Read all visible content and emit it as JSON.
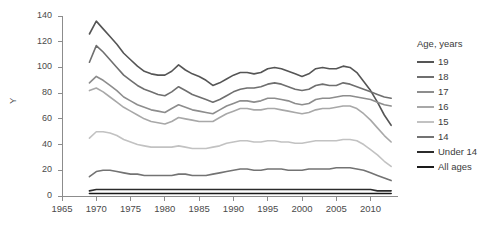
{
  "axis": {
    "y_title": "Y",
    "y_ticks": [
      0,
      20,
      40,
      60,
      80,
      100,
      120,
      140
    ],
    "x_ticks": [
      1965,
      1970,
      1975,
      1980,
      1985,
      1990,
      1995,
      2000,
      2005,
      2010
    ]
  },
  "legend": {
    "title": "Age, years",
    "items": [
      {
        "label": "19",
        "color": "#555555"
      },
      {
        "label": "18",
        "color": "#6f6f6f"
      },
      {
        "label": "17",
        "color": "#8d8d8d"
      },
      {
        "label": "16",
        "color": "#a8a8a8"
      },
      {
        "label": "15",
        "color": "#c2c2c2"
      },
      {
        "label": "14",
        "color": "#737373"
      },
      {
        "label": "Under 14",
        "color": "#2b2b2b"
      },
      {
        "label": "All ages",
        "color": "#1a1a1a"
      }
    ]
  },
  "chart_data": {
    "type": "line",
    "title": "",
    "xlabel": "",
    "ylabel": "Y",
    "xlim": [
      1965,
      2014
    ],
    "ylim": [
      0,
      140
    ],
    "grid": false,
    "legend_position": "right",
    "legend_title": "Age, years",
    "x": [
      1969,
      1970,
      1971,
      1972,
      1973,
      1974,
      1975,
      1976,
      1977,
      1978,
      1979,
      1980,
      1981,
      1982,
      1983,
      1984,
      1985,
      1986,
      1987,
      1988,
      1989,
      1990,
      1991,
      1992,
      1993,
      1994,
      1995,
      1996,
      1997,
      1998,
      1999,
      2000,
      2001,
      2002,
      2003,
      2004,
      2005,
      2006,
      2007,
      2008,
      2009,
      2010,
      2011,
      2012,
      2013
    ],
    "series": [
      {
        "name": "19",
        "color": "#555555",
        "values": [
          126,
          136,
          130,
          124,
          118,
          111,
          106,
          101,
          97,
          95,
          94,
          94,
          97,
          102,
          98,
          95,
          93,
          90,
          86,
          88,
          91,
          94,
          96,
          96,
          95,
          96,
          99,
          100,
          99,
          97,
          95,
          93,
          95,
          99,
          100,
          99,
          99,
          101,
          100,
          96,
          89,
          82,
          73,
          63,
          55
        ]
      },
      {
        "name": "18",
        "color": "#6f6f6f",
        "values": [
          104,
          117,
          112,
          106,
          100,
          94,
          90,
          86,
          83,
          81,
          79,
          78,
          81,
          85,
          82,
          79,
          77,
          75,
          73,
          75,
          78,
          81,
          83,
          84,
          84,
          85,
          87,
          88,
          87,
          85,
          83,
          82,
          83,
          86,
          87,
          86,
          86,
          88,
          87,
          85,
          83,
          81,
          79,
          77,
          76
        ]
      },
      {
        "name": "17",
        "color": "#8d8d8d",
        "values": [
          88,
          93,
          90,
          86,
          82,
          77,
          74,
          71,
          69,
          67,
          66,
          65,
          68,
          71,
          69,
          67,
          66,
          65,
          64,
          67,
          70,
          72,
          74,
          74,
          73,
          74,
          76,
          76,
          75,
          74,
          72,
          71,
          72,
          75,
          76,
          76,
          77,
          78,
          78,
          77,
          76,
          75,
          73,
          71,
          70
        ]
      },
      {
        "name": "16",
        "color": "#a8a8a8",
        "values": [
          82,
          84,
          81,
          77,
          73,
          69,
          66,
          63,
          60,
          58,
          57,
          56,
          58,
          61,
          60,
          59,
          58,
          58,
          58,
          61,
          64,
          66,
          68,
          68,
          67,
          67,
          68,
          68,
          67,
          66,
          65,
          64,
          65,
          67,
          68,
          68,
          69,
          70,
          70,
          68,
          64,
          59,
          53,
          47,
          42
        ]
      },
      {
        "name": "15",
        "color": "#c2c2c2",
        "values": [
          45,
          50,
          50,
          49,
          47,
          44,
          42,
          40,
          39,
          38,
          38,
          38,
          38,
          39,
          38,
          37,
          37,
          37,
          38,
          39,
          41,
          42,
          43,
          43,
          42,
          42,
          43,
          43,
          42,
          42,
          41,
          41,
          42,
          43,
          43,
          43,
          43,
          44,
          44,
          43,
          40,
          36,
          32,
          27,
          23
        ]
      },
      {
        "name": "14",
        "color": "#737373",
        "values": [
          15,
          19,
          20,
          20,
          19,
          18,
          17,
          17,
          16,
          16,
          16,
          16,
          16,
          17,
          17,
          16,
          16,
          16,
          17,
          18,
          19,
          20,
          21,
          21,
          20,
          20,
          21,
          21,
          21,
          20,
          20,
          20,
          21,
          21,
          21,
          21,
          22,
          22,
          22,
          21,
          20,
          18,
          16,
          14,
          12
        ]
      },
      {
        "name": "Under 14",
        "color": "#2b2b2b",
        "values": [
          4,
          5,
          5,
          5,
          5,
          5,
          5,
          5,
          5,
          5,
          5,
          5,
          5,
          5,
          5,
          5,
          5,
          5,
          5,
          5,
          5,
          5,
          5,
          5,
          5,
          5,
          5,
          5,
          5,
          5,
          5,
          5,
          5,
          5,
          5,
          5,
          5,
          5,
          5,
          5,
          5,
          5,
          4,
          4,
          4
        ]
      },
      {
        "name": "All ages",
        "color": "#1a1a1a",
        "values": [
          2,
          2,
          2,
          2,
          2,
          2,
          2,
          2,
          2,
          2,
          2,
          2,
          2,
          2,
          2,
          2,
          2,
          2,
          2,
          2,
          2,
          2,
          2,
          2,
          2,
          2,
          2,
          2,
          2,
          2,
          2,
          2,
          2,
          2,
          2,
          2,
          2,
          2,
          2,
          2,
          2,
          2,
          2,
          2,
          2
        ]
      }
    ]
  }
}
